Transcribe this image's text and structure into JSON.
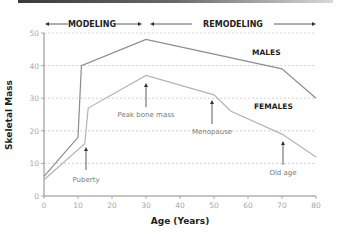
{
  "chart_data": {
    "type": "line",
    "title": "",
    "xlabel": "Age (Years)",
    "ylabel": "Skeletal Mass",
    "xlim": [
      0,
      80
    ],
    "ylim": [
      0,
      50
    ],
    "x_ticks": [
      "0",
      "10",
      "20",
      "30",
      "40",
      "50",
      "60",
      "70",
      "80"
    ],
    "y_ticks": [
      "0",
      "10",
      "20",
      "30",
      "40",
      "50"
    ],
    "grid": "horizontal dashed",
    "phases": [
      {
        "label": "MODELING",
        "x_range": [
          0,
          30
        ]
      },
      {
        "label": "REMODELING",
        "x_range": [
          30,
          80
        ]
      }
    ],
    "series": [
      {
        "name": "MALES",
        "color": "#8c8c8c",
        "x": [
          0,
          10,
          11,
          30,
          70,
          80
        ],
        "y": [
          6,
          18,
          40,
          48,
          39,
          30
        ]
      },
      {
        "name": "FEMALES",
        "color": "#b4b4b4",
        "x": [
          0,
          12,
          13,
          30,
          50,
          55,
          70,
          80
        ],
        "y": [
          5,
          16,
          27,
          37,
          31,
          26,
          19,
          12
        ]
      }
    ],
    "annotations": [
      {
        "label": "Puberty",
        "x": 12
      },
      {
        "label": "Peak bone mass",
        "x": 30
      },
      {
        "label": "Menopause",
        "x": 49
      },
      {
        "label": "Old age",
        "x": 70
      }
    ]
  }
}
